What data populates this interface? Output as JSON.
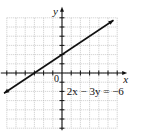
{
  "chart_data": {
    "type": "line",
    "title": "",
    "xlabel": "x",
    "ylabel": "y",
    "origin_label": "0",
    "xlim": [
      -6,
      6
    ],
    "ylim": [
      -6,
      6
    ],
    "grid": true,
    "tick_step": 1,
    "series": [
      {
        "name": "2x - 3y = -6",
        "equation": "2x − 3y = −6",
        "slope": 0.6667,
        "y_intercept": 2,
        "x_intercept": -3,
        "x": [
          -6,
          6
        ],
        "y": [
          -2,
          6
        ],
        "arrows": "both"
      }
    ],
    "annotations": [
      {
        "text": "2x − 3y = −6",
        "x": 0.3,
        "y": -2
      }
    ]
  }
}
